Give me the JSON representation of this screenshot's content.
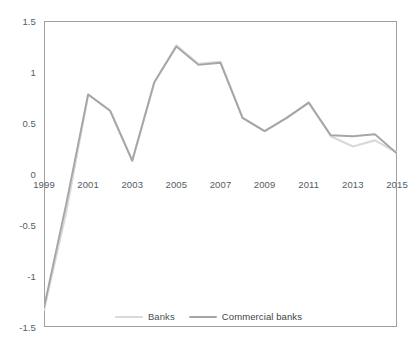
{
  "chart_data": {
    "type": "line",
    "title": "",
    "xlabel": "",
    "ylabel": "",
    "x": [
      1999,
      2000,
      2001,
      2002,
      2003,
      2004,
      2005,
      2006,
      2007,
      2008,
      2009,
      2010,
      2011,
      2012,
      2013,
      2014,
      2015
    ],
    "xlim": [
      1999,
      2015
    ],
    "ylim": [
      -1.5,
      1.5
    ],
    "yticks": [
      1.5,
      1,
      0.5,
      0,
      -0.5,
      -1,
      -1.5
    ],
    "ytick_labels": [
      "1.5",
      "1",
      "0.5",
      "0",
      "-0.5",
      "-1",
      "-1.5"
    ],
    "xtick_labels": [
      "1999",
      "2001",
      "2003",
      "2005",
      "2007",
      "2009",
      "2011",
      "2013",
      "2015"
    ],
    "xticks": [
      1999,
      2001,
      2003,
      2005,
      2007,
      2009,
      2011,
      2013,
      2015
    ],
    "xaxis_labels_at_zero": true,
    "grid": false,
    "legend_position": "bottom-center",
    "series": [
      {
        "name": "Banks",
        "color": "#d9d9d9",
        "values": [
          -1.33,
          -0.38,
          0.78,
          0.62,
          0.13,
          0.9,
          1.26,
          1.08,
          1.1,
          0.55,
          0.42,
          0.55,
          0.7,
          0.37,
          0.27,
          0.33,
          0.21
        ]
      },
      {
        "name": "Commercial banks",
        "color": "#a6a6a6",
        "values": [
          -1.31,
          -0.3,
          0.78,
          0.62,
          0.13,
          0.9,
          1.25,
          1.07,
          1.09,
          0.55,
          0.42,
          0.55,
          0.7,
          0.38,
          0.37,
          0.39,
          0.2
        ]
      }
    ]
  },
  "legend": {
    "items": [
      {
        "label": "Banks",
        "color": "#d9d9d9"
      },
      {
        "label": "Commercial banks",
        "color": "#a6a6a6"
      }
    ]
  },
  "axis": {
    "y_tick_labels": [
      "1.5",
      "1",
      "0.5",
      "0",
      "-0.5",
      "-1",
      "-1.5"
    ],
    "x_tick_labels": [
      "1999",
      "2001",
      "2003",
      "2005",
      "2007",
      "2009",
      "2011",
      "2013",
      "2015"
    ]
  },
  "colors": {
    "plot_border": "#a0a0a0",
    "axis_text": "#555c62",
    "legend_text": "#3f4347",
    "background": "#ffffff",
    "series_banks": "#d9d9d9",
    "series_commercial_banks": "#a6a6a6"
  }
}
